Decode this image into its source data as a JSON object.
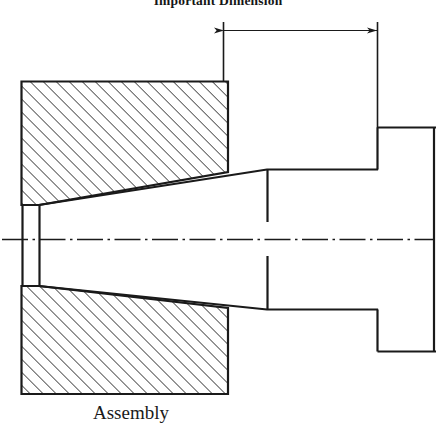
{
  "figure": {
    "caption": "Assembly",
    "dimension_label": "Important Dimension",
    "type": "engineering-section-drawing",
    "colors": {
      "line": "#1a1a1a",
      "hatch": "#2b2b2b",
      "background": "#ffffff",
      "centerline": "#1a1a1a"
    }
  },
  "drawing": {
    "title": "Important Dimension",
    "caption": "Assembly",
    "centerline_y": 239,
    "dimension": {
      "label": "Important Dimension",
      "line_y": 30,
      "x_start": 223,
      "x_end": 377,
      "extension_left_x": 223,
      "extension_left_y1": 22,
      "extension_left_y2": 82,
      "extension_right_x": 377,
      "extension_right_y1": 22,
      "extension_right_y2": 128,
      "arrow_style": "filled-double-arrow"
    },
    "housing_upper": {
      "name": "housing-upper-section",
      "x_left": 21,
      "x_right": 228,
      "y_top": 81,
      "y_bottom_left": 205,
      "y_bottom_right": 172,
      "hatched": true,
      "hatch_angle_deg": 45
    },
    "housing_lower": {
      "name": "housing-lower-section",
      "x_left": 21,
      "x_right": 228,
      "y_top_left": 286,
      "y_top_right": 308,
      "y_bottom": 394,
      "hatched": true,
      "hatch_angle_deg": 45
    },
    "shaft": {
      "name": "tapered-shaft",
      "taper_small_x": 39,
      "taper_small_top_y": 205,
      "taper_small_bottom_y": 286,
      "taper_large_x": 267,
      "taper_large_top_y": 169,
      "taper_large_bottom_y": 309,
      "barrel_x_end": 377,
      "barrel_top_y": 169,
      "barrel_bottom_y": 309
    },
    "bore_end": {
      "name": "bore-end-face",
      "x": 22,
      "y_top": 205,
      "y_bottom": 286
    },
    "flange": {
      "name": "shaft-flange",
      "x_left": 377,
      "x_right": 434,
      "y_top": 127,
      "y_bottom": 351
    },
    "tick_marks": [
      {
        "name": "taper-junction-tick-upper",
        "x": 267,
        "y1": 170,
        "y2": 222
      },
      {
        "name": "taper-junction-tick-lower",
        "x": 267,
        "y1": 256,
        "y2": 309
      }
    ]
  }
}
